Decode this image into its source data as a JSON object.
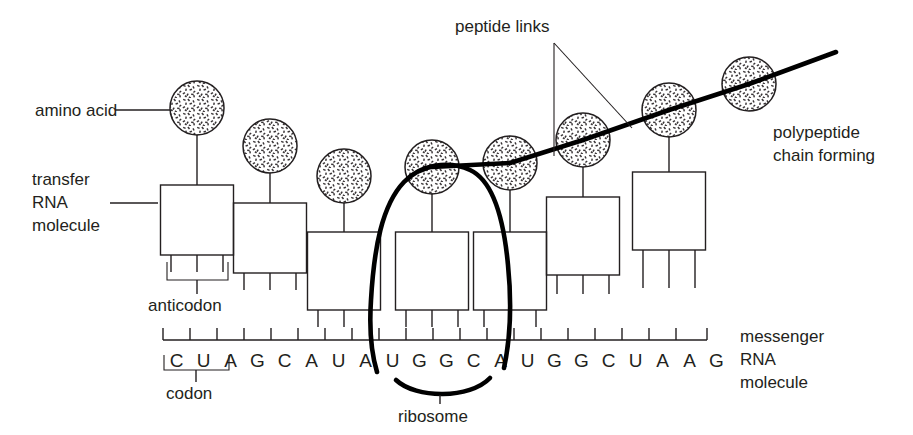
{
  "diagram": {
    "labels": {
      "amino_acid": "amino acid",
      "transfer_rna_line1": "transfer",
      "transfer_rna_line2": "RNA",
      "transfer_rna_line3": "molecule",
      "anticodon": "anticodon",
      "codon": "codon",
      "ribosome": "ribosome",
      "peptide_links": "peptide links",
      "polypeptide_line1": "polypeptide",
      "polypeptide_line2": "chain forming",
      "messenger_rna_line1": "messenger",
      "messenger_rna_line2": "RNA",
      "messenger_rna_line3": "molecule"
    },
    "mrna": {
      "sequence": [
        "C",
        "U",
        "A",
        "G",
        "C",
        "A",
        "U",
        "A",
        "U",
        "G",
        "G",
        "C",
        "A",
        "U",
        "G",
        "G",
        "C",
        "U",
        "A",
        "A",
        "G"
      ],
      "base_count": 21,
      "codon_bracket_bases": [
        "C",
        "U",
        "A"
      ],
      "codon_bracket_index_start": 0,
      "codon_bracket_index_end": 2
    },
    "trna_count": 7,
    "amino_acid_count": 7,
    "ribosome_covers_bases": [
      "U",
      "G",
      "G",
      "C",
      "A"
    ],
    "ribosome_base_index_start": 8,
    "ribosome_base_index_end": 12,
    "colors": {
      "ink": "#231f20",
      "line": "#000000",
      "background": "#ffffff"
    }
  }
}
